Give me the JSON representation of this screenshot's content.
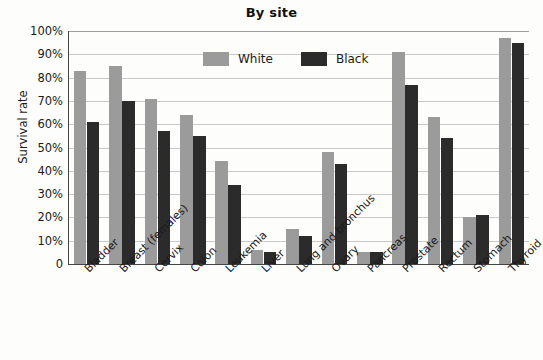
{
  "chart_data": {
    "type": "bar",
    "title": "By site",
    "xlabel": "",
    "ylabel": "Survival rate",
    "ylim": [
      0,
      100
    ],
    "grid": true,
    "legend_position": "top-center-inside",
    "categories": [
      "Bladder",
      "Breast (females)",
      "Cervix",
      "Colon",
      "Leukemia",
      "Liver",
      "Lung and bronchus",
      "Ovary",
      "Pancreas",
      "Prostate",
      "Rectum",
      "Stomach",
      "Thyroid"
    ],
    "y_ticks": [
      "0",
      "10%",
      "20%",
      "30%",
      "40%",
      "50%",
      "60%",
      "70%",
      "80%",
      "90%",
      "100%"
    ],
    "y_tick_values": [
      0,
      10,
      20,
      30,
      40,
      50,
      60,
      70,
      80,
      90,
      100
    ],
    "series": [
      {
        "name": "White",
        "color": "#9b9b9b",
        "values": [
          83,
          85,
          71,
          64,
          44,
          6,
          15,
          48,
          5,
          91,
          63,
          20,
          97
        ]
      },
      {
        "name": "Black",
        "color": "#2b2b2b",
        "values": [
          61,
          70,
          57,
          55,
          34,
          5,
          12,
          43,
          5,
          77,
          54,
          21,
          95
        ]
      }
    ]
  },
  "colors": {
    "white_series": "#9b9b9b",
    "black_series": "#2b2b2b",
    "gridline": "#c9c9c9",
    "axis": "#444444",
    "background": "#fdfdfc",
    "text": "#1a1a1a"
  }
}
